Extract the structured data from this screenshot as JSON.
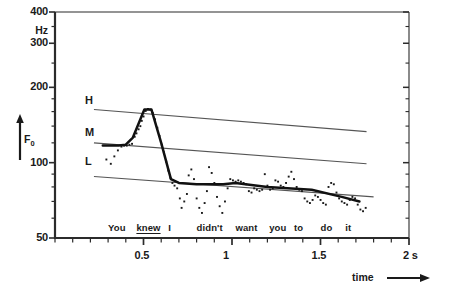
{
  "chart_data": {
    "type": "line",
    "title": "",
    "subtitle": "",
    "xlabel": "time",
    "ylabel": "F0",
    "yunit": "Hz",
    "xlim": [
      0,
      2
    ],
    "ylim": [
      50,
      400
    ],
    "yscale": "log",
    "xscale": "linear",
    "grid": false,
    "legend_position": "none",
    "xticks_major": [
      0.5,
      1,
      1.5,
      2
    ],
    "xticklabels": [
      "0.5",
      "1",
      "1.5",
      "2 s"
    ],
    "xtick_minor_step": 0.1,
    "yticks_major": [
      50,
      100,
      200,
      300,
      400
    ],
    "yticklabels": [
      "50",
      "100",
      "200",
      "300",
      "400"
    ],
    "yticks_minor": [
      60,
      70,
      80,
      90,
      120,
      140,
      160,
      180,
      250,
      350
    ],
    "utterance": {
      "label": "You knew I didn't want you to do it",
      "stressed_word": "knew",
      "words": [
        {
          "text": "You",
          "t": 0.3,
          "stressed": false
        },
        {
          "text": "knew",
          "t": 0.46,
          "stressed": true
        },
        {
          "text": "I",
          "t": 0.64,
          "stressed": false
        },
        {
          "text": "didn't",
          "t": 0.8,
          "stressed": false
        },
        {
          "text": "want",
          "t": 1.02,
          "stressed": false
        },
        {
          "text": "you",
          "t": 1.21,
          "stressed": false
        },
        {
          "text": "to",
          "t": 1.35,
          "stressed": false
        },
        {
          "text": "do",
          "t": 1.5,
          "stressed": false
        },
        {
          "text": "it",
          "t": 1.64,
          "stressed": false
        }
      ]
    },
    "series": [
      {
        "name": "H",
        "type": "reference-line",
        "label": "H",
        "label_t": 0.17,
        "label_f0": 175,
        "points": [
          [
            0.22,
            163
          ],
          [
            1.76,
            133
          ]
        ]
      },
      {
        "name": "M",
        "type": "reference-line",
        "label": "M",
        "label_t": 0.17,
        "label_f0": 130,
        "points": [
          [
            0.22,
            120
          ],
          [
            1.76,
            99
          ]
        ]
      },
      {
        "name": "L",
        "type": "reference-line",
        "label": "L",
        "label_t": 0.17,
        "label_f0": 100,
        "points": [
          [
            0.22,
            88
          ],
          [
            1.8,
            73
          ]
        ]
      },
      {
        "name": "stylized-f0-contour",
        "type": "line",
        "points": [
          [
            0.27,
            117
          ],
          [
            0.36,
            117
          ],
          [
            0.4,
            118
          ],
          [
            0.44,
            126
          ],
          [
            0.505,
            163
          ],
          [
            0.545,
            163
          ],
          [
            0.6,
            120
          ],
          [
            0.655,
            86
          ],
          [
            0.7,
            83
          ],
          [
            0.8,
            82
          ],
          [
            0.95,
            82
          ],
          [
            1.02,
            83
          ],
          [
            1.2,
            80
          ],
          [
            1.45,
            78
          ],
          [
            1.62,
            73
          ],
          [
            1.72,
            70
          ]
        ]
      },
      {
        "name": "measured-f0-points",
        "type": "scatter",
        "points": [
          [
            0.29,
            103
          ],
          [
            0.315,
            99
          ],
          [
            0.335,
            106
          ],
          [
            0.355,
            112
          ],
          [
            0.375,
            116
          ],
          [
            0.39,
            117
          ],
          [
            0.405,
            117
          ],
          [
            0.42,
            118
          ],
          [
            0.435,
            119
          ],
          [
            0.45,
            127
          ],
          [
            0.46,
            131
          ],
          [
            0.472,
            136
          ],
          [
            0.482,
            140
          ],
          [
            0.49,
            147
          ],
          [
            0.5,
            153
          ],
          [
            0.512,
            161
          ],
          [
            0.525,
            164
          ],
          [
            0.538,
            163
          ],
          [
            0.552,
            158
          ],
          [
            0.565,
            149
          ],
          [
            0.578,
            138
          ],
          [
            0.59,
            128
          ],
          [
            0.603,
            118
          ],
          [
            0.615,
            110
          ],
          [
            0.628,
            101
          ],
          [
            0.64,
            93
          ],
          [
            0.652,
            87
          ],
          [
            0.663,
            83
          ],
          [
            0.675,
            81
          ],
          [
            0.69,
            79
          ],
          [
            0.705,
            72
          ],
          [
            0.715,
            66
          ],
          [
            0.73,
            70
          ],
          [
            0.745,
            75
          ],
          [
            0.755,
            89
          ],
          [
            0.77,
            94
          ],
          [
            0.785,
            86
          ],
          [
            0.8,
            72
          ],
          [
            0.815,
            66
          ],
          [
            0.83,
            63
          ],
          [
            0.845,
            69
          ],
          [
            0.858,
            77
          ],
          [
            0.87,
            96
          ],
          [
            0.885,
            91
          ],
          [
            0.9,
            83
          ],
          [
            0.915,
            73
          ],
          [
            0.93,
            67
          ],
          [
            0.945,
            63
          ],
          [
            0.96,
            70
          ],
          [
            0.975,
            79
          ],
          [
            0.99,
            86
          ],
          [
            1.005,
            85
          ],
          [
            1.02,
            84
          ],
          [
            1.035,
            85
          ],
          [
            1.05,
            84
          ],
          [
            1.065,
            83
          ],
          [
            1.08,
            82
          ],
          [
            1.095,
            77
          ],
          [
            1.11,
            76
          ],
          [
            1.125,
            79
          ],
          [
            1.14,
            78
          ],
          [
            1.155,
            77
          ],
          [
            1.17,
            78
          ],
          [
            1.185,
            90
          ],
          [
            1.2,
            81
          ],
          [
            1.215,
            78
          ],
          [
            1.23,
            79
          ],
          [
            1.245,
            85
          ],
          [
            1.26,
            84
          ],
          [
            1.275,
            81
          ],
          [
            1.29,
            80
          ],
          [
            1.305,
            83
          ],
          [
            1.32,
            88
          ],
          [
            1.335,
            92
          ],
          [
            1.35,
            86
          ],
          [
            1.365,
            80
          ],
          [
            1.38,
            78
          ],
          [
            1.395,
            77
          ],
          [
            1.41,
            72
          ],
          [
            1.425,
            70
          ],
          [
            1.44,
            69
          ],
          [
            1.455,
            71
          ],
          [
            1.47,
            74
          ],
          [
            1.485,
            73
          ],
          [
            1.5,
            71
          ],
          [
            1.515,
            69
          ],
          [
            1.53,
            68
          ],
          [
            1.545,
            80
          ],
          [
            1.56,
            83
          ],
          [
            1.575,
            82
          ],
          [
            1.59,
            76
          ],
          [
            1.605,
            72
          ],
          [
            1.62,
            70
          ],
          [
            1.635,
            69
          ],
          [
            1.65,
            68
          ],
          [
            1.665,
            71
          ],
          [
            1.68,
            73
          ],
          [
            1.695,
            72
          ],
          [
            1.71,
            68
          ],
          [
            1.725,
            65
          ],
          [
            1.74,
            64
          ],
          [
            1.755,
            66
          ]
        ]
      }
    ]
  },
  "axes": {
    "unit_label": "Hz",
    "f0_label": "F₀",
    "time_label": "time"
  },
  "colors": {
    "ink": "#1a1a1a",
    "axis": "#2b2b2b",
    "reference_line": "#555555",
    "contour": "#111111",
    "background": "#ffffff"
  }
}
